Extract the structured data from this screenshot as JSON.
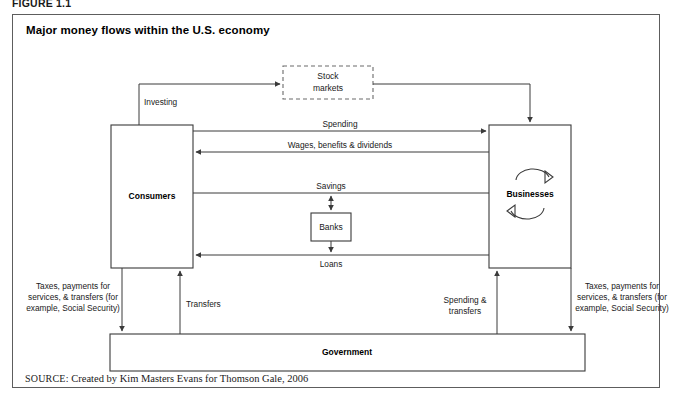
{
  "figure": {
    "label": "FIGURE 1.1",
    "title": "Major money flows within the U.S. economy",
    "source_word": "SOURCE:",
    "source_text": "Created by Kim Masters Evans for Thomson Gale, 2006"
  },
  "nodes": {
    "consumers": {
      "label": "Consumers"
    },
    "businesses": {
      "label": "Businesses"
    },
    "banks": {
      "label": "Banks"
    },
    "government": {
      "label": "Government"
    },
    "stock_markets": {
      "line1": "Stock",
      "line2": "markets"
    }
  },
  "flows": {
    "investing": "Investing",
    "spending": "Spending",
    "wages": "Wages, benefits & dividends",
    "savings": "Savings",
    "loans": "Loans",
    "transfers": "Transfers",
    "spending_transfers_line1": "Spending &",
    "spending_transfers_line2": "transfers",
    "taxes_left_line1": "Taxes, payments for",
    "taxes_left_line2": "services, & transfers (for",
    "taxes_left_line3": "example, Social Security)",
    "taxes_right_line1": "Taxes, payments for",
    "taxes_right_line2": "services, & transfers (for",
    "taxes_right_line3": "example, Social Security)"
  },
  "colors": {
    "frame": "#5d5d5d",
    "line": "#3a3a3a",
    "dashed": "#6a6a6a",
    "background": "#ffffff",
    "text": "#1a1a1a"
  }
}
